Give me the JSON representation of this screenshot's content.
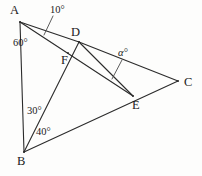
{
  "figure": {
    "type": "geometry-diagram",
    "width": 202,
    "height": 176,
    "background_color": "#fdfdfc",
    "stroke_color": "#2b2b2b",
    "text_color": "#1b1b1b"
  },
  "vertices": [
    {
      "name": "A",
      "label": "A",
      "x": 20,
      "y": 22,
      "label_x": 10,
      "label_y": 4
    },
    {
      "name": "B",
      "label": "B",
      "x": 24,
      "y": 152,
      "label_x": 17,
      "label_y": 155
    },
    {
      "name": "C",
      "label": "C",
      "x": 178,
      "y": 81,
      "label_x": 184,
      "label_y": 76
    },
    {
      "name": "D",
      "label": "D",
      "x": 79,
      "y": 42,
      "label_x": 71,
      "label_y": 26
    },
    {
      "name": "E",
      "label": "E",
      "x": 133,
      "y": 96,
      "label_x": 132,
      "label_y": 99
    },
    {
      "name": "F",
      "label": "F",
      "x": 68,
      "y": 53,
      "label_x": 61,
      "label_y": 54
    }
  ],
  "segments": [
    {
      "name": "segment-A-B",
      "from": "A",
      "to": "B"
    },
    {
      "name": "segment-A-D",
      "from": "A",
      "to": "D"
    },
    {
      "name": "segment-A-E",
      "from": "A",
      "to": "E"
    },
    {
      "name": "segment-B-D",
      "from": "B",
      "to": "D"
    },
    {
      "name": "segment-B-C",
      "from": "B",
      "to": "C"
    },
    {
      "name": "segment-D-C",
      "from": "D",
      "to": "C"
    },
    {
      "name": "segment-D-E",
      "from": "D",
      "to": "E"
    }
  ],
  "angle_labels": [
    {
      "name": "angle-10",
      "text": "10°",
      "x": 50,
      "y": 5,
      "italic": false
    },
    {
      "name": "angle-60",
      "text": "60°",
      "x": 13,
      "y": 38,
      "italic": false
    },
    {
      "name": "angle-alpha",
      "text": "α°",
      "x": 118,
      "y": 48,
      "italic": true
    },
    {
      "name": "angle-30",
      "text": "30°",
      "x": 27,
      "y": 106,
      "italic": false
    },
    {
      "name": "angle-40",
      "text": "40°",
      "x": 36,
      "y": 127,
      "italic": false
    }
  ],
  "leader_lines": [
    {
      "name": "leader-10",
      "x1": 53,
      "y1": 16,
      "x2": 44,
      "y2": 35
    },
    {
      "name": "leader-alpha",
      "x1": 122,
      "y1": 60,
      "x2": 112,
      "y2": 79
    }
  ]
}
